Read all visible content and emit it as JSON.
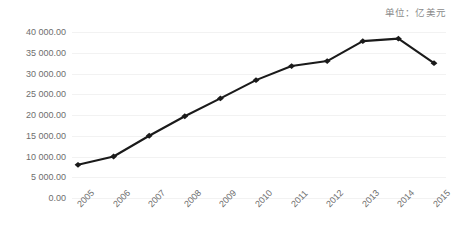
{
  "unit_caption": "单位：亿美元",
  "chart_data": {
    "type": "line",
    "title": "",
    "subtitle": "",
    "xlabel": "",
    "ylabel": "",
    "unit_label": "单位：亿美元",
    "categories": [
      "2005",
      "2006",
      "2007",
      "2008",
      "2009",
      "2010",
      "2011",
      "2012",
      "2013",
      "2014",
      "2015"
    ],
    "values": [
      8000,
      10000,
      15000,
      19700,
      24000,
      28400,
      31800,
      33000,
      37800,
      38400,
      32500
    ],
    "series": [
      {
        "name": "",
        "values": [
          8000,
          10000,
          15000,
          19700,
          24000,
          28400,
          31800,
          33000,
          37800,
          38400,
          32500
        ]
      }
    ],
    "ylim": [
      0,
      40000
    ],
    "ytick_values": [
      0,
      5000,
      10000,
      15000,
      20000,
      25000,
      30000,
      35000,
      40000
    ],
    "ytick_labels": [
      "0.00",
      "5 000.00",
      "10 000.00",
      "15 000.00",
      "20 000.00",
      "25 000.00",
      "30 000.00",
      "35 000.00",
      "40 000.00"
    ],
    "grid": true,
    "grid_axis": "y",
    "legend": false,
    "legend_position": "none",
    "line_color": "#1a1a1a",
    "marker": "diamond",
    "xtick_rotation": -45,
    "background_color": "#ffffff",
    "gridline_color": "#f2f2f2",
    "tick_label_color": "#6e6e6e"
  }
}
